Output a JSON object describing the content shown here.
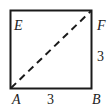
{
  "diagram": {
    "type": "geometry-square",
    "vertices": {
      "A": "A",
      "B": "B",
      "F": "F",
      "E": "E"
    },
    "side_labels": {
      "AB": "3",
      "BF": "3"
    },
    "dashed_segment": "AF",
    "colors": {
      "stroke": "#1a1a1a",
      "text": "#222222",
      "background": "#ffffff"
    }
  }
}
